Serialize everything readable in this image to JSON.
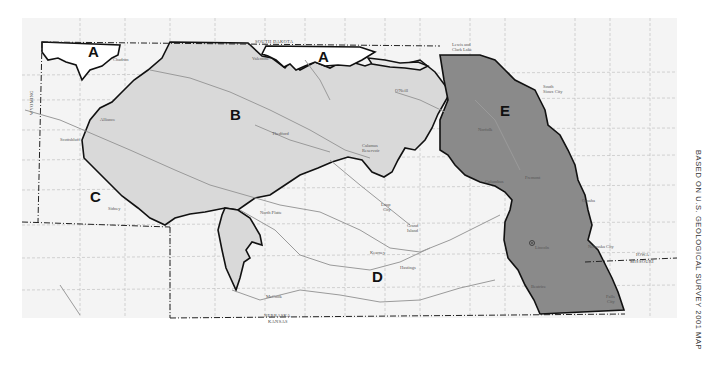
{
  "map": {
    "colors": {
      "background": "#ffffff",
      "paper": "#f4f4f4",
      "region_light": "#d9d9d9",
      "region_dark": "#8a8a8a",
      "boundary": "#111111",
      "river": "#9a9a9a",
      "grid": "#b8b8b8"
    },
    "regions": [
      {
        "id": "A",
        "label": "A",
        "shade": "white"
      },
      {
        "id": "A2",
        "label": "A",
        "shade": "white"
      },
      {
        "id": "B",
        "label": "B",
        "shade": "light-gray"
      },
      {
        "id": "C",
        "label": "C",
        "shade": "white"
      },
      {
        "id": "D",
        "label": "D",
        "shade": "white"
      },
      {
        "id": "E",
        "label": "E",
        "shade": "dark-gray"
      }
    ],
    "states": {
      "south_dakota": "SOUTH DAKOTA",
      "wyoming": "WYOMING",
      "nebraska": "NEBRASKA",
      "kansas": "KANSAS",
      "iowa": "IOWA",
      "missouri": "MISSOURI"
    },
    "cities": {
      "chadron": "Chadron",
      "alliance": "Alliance",
      "scottsbluff": "Scottsbluff",
      "sidney": "Sidney",
      "valentine": "Valentine",
      "oneill": "O'Neill",
      "thedford": "Thedford",
      "north_platte": "North Platte",
      "mccook": "McCook",
      "kearney": "Kearney",
      "hastings": "Hastings",
      "grand_island_1": "Grand",
      "grand_island_2": "Island",
      "loup_city_1": "Loup",
      "loup_city_2": "City",
      "columbus": "Columbus",
      "norfolk": "Norfolk",
      "fremont": "Fremont",
      "omaha": "Omaha",
      "lincoln": "Lincoln",
      "beatrice": "Beatrice",
      "nebraska_city": "Nebraska City",
      "falls_city_1": "Falls",
      "falls_city_2": "City",
      "south_sioux_city_1": "South",
      "south_sioux_city_2": "Sioux City",
      "lewis_clark_1": "Lewis and",
      "lewis_clark_2": "Clark Lake",
      "calamus_1": "Calamus",
      "calamus_2": "Reservoir"
    },
    "credit": "BASED ON U.S. GEOLOGICAL SURVEY 2001 MAP"
  }
}
